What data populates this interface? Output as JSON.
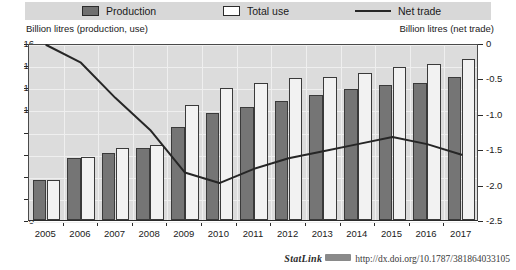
{
  "legend": {
    "items": [
      {
        "label": "Production",
        "marker": "filled-square-swatch",
        "color": "#707070"
      },
      {
        "label": "Total use",
        "marker": "hollow-square-swatch",
        "color": "#ffffff"
      },
      {
        "label": "Net trade",
        "marker": "line-swatch",
        "color": "#262626"
      }
    ]
  },
  "axis_titles": {
    "left": "Billion litres (production, use)",
    "right": "Billion litres (net trade)"
  },
  "footer": {
    "statlink_word": "StatLink",
    "statlink_badge": "statlink-badge-icon",
    "url": "http://dx.doi.org/10.1787/381864033105"
  },
  "chart_data": {
    "type": "bar",
    "title": "",
    "xlabel": "",
    "ylabel": "Billion litres (production, use)",
    "y2label": "Billion litres (net trade)",
    "ylim": [
      0,
      16
    ],
    "y2lim": [
      -2.5,
      0
    ],
    "grid": true,
    "legend_position": "top",
    "categories": [
      "2005",
      "2006",
      "2007",
      "2008",
      "2009",
      "2010",
      "2011",
      "2012",
      "2013",
      "2014",
      "2015",
      "2016",
      "2017"
    ],
    "yticks": [
      "0",
      "2",
      "4",
      "6",
      "8",
      "10",
      "12",
      "14",
      "16"
    ],
    "y2ticks": [
      "0",
      "-0.5",
      "-1.0",
      "-1.5",
      "-2.0",
      "-2.5"
    ],
    "series": [
      {
        "name": "Production",
        "kind": "bar",
        "axis": "left",
        "color": "#757575",
        "values": [
          3.6,
          5.6,
          6.1,
          6.5,
          8.4,
          9.7,
          10.2,
          10.8,
          11.3,
          11.8,
          12.2,
          12.4,
          12.9
        ]
      },
      {
        "name": "Total use",
        "kind": "bar",
        "axis": "left",
        "color": "#f2f2f2",
        "values": [
          3.6,
          5.7,
          6.5,
          6.8,
          10.4,
          11.9,
          12.4,
          12.8,
          12.9,
          13.3,
          13.8,
          14.1,
          14.6
        ]
      },
      {
        "name": "Net trade",
        "kind": "line",
        "axis": "right",
        "color": "#262626",
        "values": [
          0.0,
          -0.25,
          -0.75,
          -1.2,
          -1.8,
          -1.95,
          -1.75,
          -1.6,
          -1.5,
          -1.4,
          -1.3,
          -1.4,
          -1.55
        ]
      }
    ]
  }
}
